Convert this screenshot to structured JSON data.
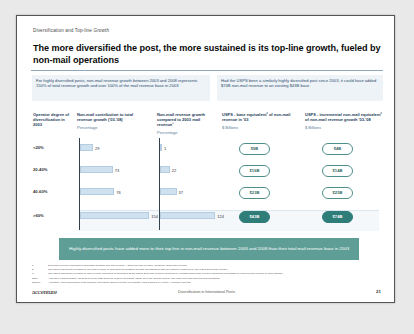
{
  "slide": {
    "kicker": "Diversification and Top-line Growth",
    "title": "The more diversified the post, the more sustained is its top-line growth, fueled by non-mail operations",
    "subtitle_left": "For highly diversified posts, non-mail revenue growth between 2003 and 2008 represents 150% of total revenue growth and over 100% of the mail revenue base in 2003",
    "subtitle_right": "Had the USPS been a similarly highly diversified post since 2003, it could have added $74B non-mail revenue to an existing $43B base",
    "callout": "Highly diversified posts have added more to their top line in non-mail revenue between 2003 and 2008 than their total mail revenue base in 2003"
  },
  "columns": {
    "c0": {
      "label": "Operator degree of diversification in 2003",
      "unit": ""
    },
    "c1": {
      "label": "Non-mail contribution to total revenue growth ('03-'08)",
      "unit": "Percentage"
    },
    "c2": {
      "label": "Non-mail revenue growth compared to 2003 mail revenue¹",
      "unit": "Percentage"
    },
    "c3": {
      "label": "USPS - base equivalent² of non-mail revenue in '03",
      "unit": "$ Billions"
    },
    "c4": {
      "label": "USPS - incremental non-mail equivalent² of non-mail revenue growth '03-'08",
      "unit": "$ Billions"
    }
  },
  "chart_data": {
    "type": "bar",
    "categories": [
      "<20%",
      "20-40%",
      "40-60%",
      ">60%"
    ],
    "xlabel": "Operator degree of diversification in 2003",
    "grid": false,
    "legend": "none",
    "series": [
      {
        "name": "Non-mail contribution to total revenue growth ('03-'08)",
        "unit": "Percentage",
        "values": [
          29,
          73,
          76,
          154
        ],
        "xlim": [
          0,
          160
        ]
      },
      {
        "name": "Non-mail revenue growth compared to 2003 mail revenue",
        "unit": "Percentage",
        "values": [
          1,
          22,
          37,
          124
        ],
        "xlim": [
          0,
          130
        ]
      },
      {
        "name": "USPS - base equivalent of non-mail revenue in '03",
        "unit": "$ Billions",
        "values": [
          "$9B",
          "$16B",
          "$23B",
          "$43B"
        ]
      },
      {
        "name": "USPS - incremental non-mail equivalent of revenue growth '03-'08",
        "unit": "$ Billions",
        "values": [
          "$4B",
          "$14B",
          "$25B",
          "$74B"
        ]
      }
    ],
    "highlight_row": ">60%"
  },
  "notes": [
    {
      "key": "1",
      "text": "2003 mail revenue equivalent is calculated as 2008 non-mail revenue – 2003 non-mail revenue, divided by 2003 mail revenue"
    },
    {
      "key": "2",
      "text": "The USPS equivalent in relation to non-mail revenue is calculated as weighted average diversification rate per category multiplied by the USPS 2003 mail revenue"
    },
    {
      "key": "3",
      "text": "The USPS equivalent in relation to mail revenue equivalent is calculated as the USPS 2003 mail revenue multiplied by weighted 2003 mail revenue equivalent percentage for each revenue column in each category"
    },
    {
      "key": "Note:",
      "text": "Analysis excludes finance, as 2003 non-mail data does not exist for operators; Japan as a unit, and the USPS. Mail page from mail and non-mail definitions"
    },
    {
      "key": "Source:",
      "text": "Accenture High Performance Post research; Operators' annual reports; IPC website; USPS 2008 10-K report; Accenture analysis"
    }
  ],
  "footer": {
    "logo": "accenture",
    "center": "Diversification in International Posts",
    "page": "21"
  }
}
